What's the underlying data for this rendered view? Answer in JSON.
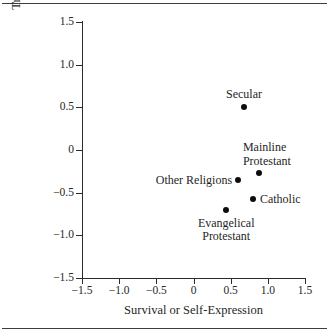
{
  "figure": {
    "has_top_rule": true,
    "has_bottom_rule": true,
    "background": "#ffffff",
    "mark_color": "#0d0d0d",
    "axis_color": "#2b2b2b"
  },
  "chart_data": {
    "type": "scatter",
    "title": "",
    "xlabel": "Survival or Self-Expression",
    "ylabel": "Traditional or Secular-Rational",
    "xlim": [
      -1.5,
      1.5
    ],
    "ylim": [
      -1.5,
      1.5
    ],
    "grid": false,
    "legend": "none",
    "xticks": [
      -1.5,
      -1.0,
      -0.5,
      0,
      0.5,
      1.0,
      1.5
    ],
    "xticklabels": [
      "−1.5",
      "−1.0",
      "−0.5",
      "0",
      "0.5",
      "1.0",
      "1.5"
    ],
    "yticks": [
      -1.5,
      -1.0,
      -0.5,
      0,
      0.5,
      1.0,
      1.5
    ],
    "yticklabels": [
      "−1.5",
      "−1.0",
      "−0.5",
      "0",
      "0.5",
      "1.0",
      "1.5"
    ],
    "points": [
      {
        "label": "Secular",
        "x": 0.68,
        "y": 0.5,
        "label_position": "above",
        "label_align": "center",
        "label_lines": [
          "Secular"
        ]
      },
      {
        "label": "Mainline Protestant",
        "x": 0.88,
        "y": -0.27,
        "label_position": "above-right",
        "label_align": "left",
        "label_lines": [
          "Mainline",
          "Protestant"
        ]
      },
      {
        "label": "Other Religions",
        "x": 0.6,
        "y": -0.35,
        "label_position": "left",
        "label_align": "right",
        "label_lines": [
          "Other Religions"
        ]
      },
      {
        "label": "Catholic",
        "x": 0.8,
        "y": -0.57,
        "label_position": "right",
        "label_align": "left",
        "label_lines": [
          "Catholic"
        ]
      },
      {
        "label": "Evangelical Protestant",
        "x": 0.44,
        "y": -0.7,
        "label_position": "below",
        "label_align": "center",
        "label_lines": [
          "Evangelical",
          "Protestant"
        ]
      }
    ]
  }
}
